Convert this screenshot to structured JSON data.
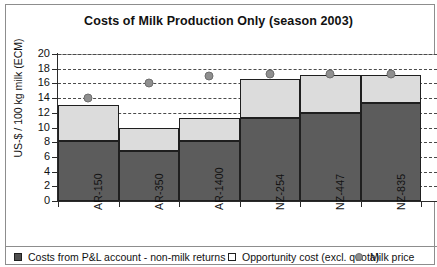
{
  "chart_data": {
    "type": "bar",
    "title": "Costs of Milk Production Only (season 2003)",
    "xlabel": "",
    "ylabel": "US-$ / 100 kg milk (ECM)",
    "ylim": [
      0,
      20
    ],
    "ytick_step": 2,
    "yticks": [
      "0",
      "2",
      "4",
      "6",
      "8",
      "10",
      "12",
      "14",
      "16",
      "18",
      "20"
    ],
    "grid": "horizontal-dashed",
    "legend_position": "bottom",
    "stacked": true,
    "categories": [
      "AR-150",
      "AR-350",
      "AR-1400",
      "NZ-254",
      "NZ-447",
      "NZ-835"
    ],
    "series": [
      {
        "name": "Costs from P&L account - non-milk returns",
        "type": "bar",
        "color": "#5c5c5c",
        "values": [
          8.2,
          6.8,
          8.2,
          11.3,
          12.0,
          13.3
        ]
      },
      {
        "name": "Opportunity cost (excl. quota)",
        "type": "bar",
        "color": "#dcdcdc",
        "values": [
          4.8,
          3.2,
          3.1,
          5.3,
          5.2,
          3.9
        ]
      },
      {
        "name": "Milk price",
        "type": "scatter",
        "color": "#8f8f8f",
        "values": [
          14.0,
          16.0,
          17.0,
          17.3,
          17.3,
          17.3
        ]
      }
    ],
    "totals": [
      13.0,
      10.0,
      11.3,
      16.6,
      17.2,
      17.2
    ]
  },
  "legend": {
    "items": [
      {
        "label": "Costs from P&L account - non-milk returns",
        "marker": "dark-square-swatch"
      },
      {
        "label": "Opportunity cost (excl. quota)",
        "marker": "light-square-swatch"
      },
      {
        "label": "Milk price",
        "marker": "grey-dot-marker"
      }
    ]
  }
}
